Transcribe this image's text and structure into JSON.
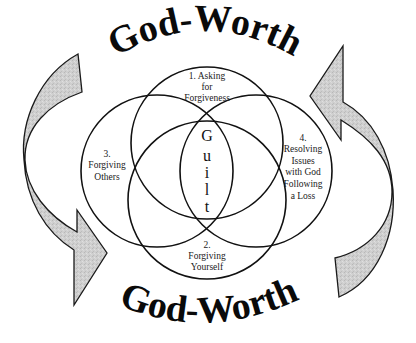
{
  "diagram": {
    "title_top": "God-Worth",
    "title_bottom": "God-Worth",
    "center": {
      "label": "Guilt",
      "letters": [
        "G",
        "u",
        "i",
        "l",
        "t"
      ]
    },
    "circles": [
      {
        "id": "top",
        "lines": [
          "1. Asking",
          "for",
          "Forgiveness"
        ]
      },
      {
        "id": "bottom",
        "lines": [
          "2.",
          "Forgiving",
          "Yourself"
        ]
      },
      {
        "id": "left",
        "lines": [
          "3.",
          "Forgiving",
          "Others"
        ]
      },
      {
        "id": "right",
        "lines": [
          "4.",
          "Resolving",
          "Issues",
          "with God",
          "Following",
          "a Loss"
        ]
      }
    ],
    "arrows": [
      {
        "id": "left-arrow",
        "direction": "down"
      },
      {
        "id": "right-arrow",
        "direction": "up"
      }
    ],
    "colors": {
      "stroke": "#111111",
      "arrow_fill": "#c8c8c8",
      "background": "#ffffff"
    }
  }
}
